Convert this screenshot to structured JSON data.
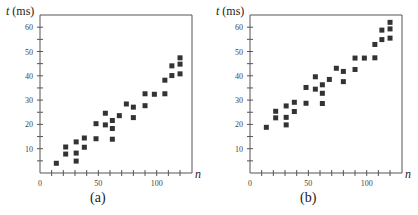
{
  "chart_data": [
    {
      "type": "scatter",
      "caption": "(a)",
      "xlabel": "n",
      "ylabel": "t (ms)",
      "ylabel_var": "t",
      "ylabel_unit": "(ms)",
      "xlim": [
        0,
        130
      ],
      "ylim": [
        0,
        65
      ],
      "xticks_major": [
        0,
        50,
        100
      ],
      "xtick_step": 10,
      "yticks_major": [
        10,
        20,
        30,
        40,
        50,
        60
      ],
      "ytick_step": 5,
      "grid": false,
      "marker": "square",
      "marker_color": "#333333",
      "points": [
        [
          14,
          4
        ],
        [
          22,
          10.7
        ],
        [
          22,
          7.8
        ],
        [
          31,
          12.8
        ],
        [
          31,
          8.2
        ],
        [
          31,
          4.9
        ],
        [
          38,
          14.4
        ],
        [
          38,
          10.6
        ],
        [
          48,
          20.3
        ],
        [
          48,
          14.1
        ],
        [
          56,
          24.6
        ],
        [
          56,
          19.8
        ],
        [
          62,
          21.6
        ],
        [
          62,
          18.3
        ],
        [
          62,
          13.9
        ],
        [
          68,
          23.6
        ],
        [
          74,
          28.4
        ],
        [
          80,
          27.1
        ],
        [
          80,
          22.8
        ],
        [
          90,
          32.6
        ],
        [
          90,
          27.7
        ],
        [
          98,
          32.4
        ],
        [
          107,
          32.6
        ],
        [
          107,
          38.2
        ],
        [
          113,
          44.1
        ],
        [
          113,
          40.1
        ],
        [
          120,
          47.4
        ],
        [
          120,
          44.8
        ],
        [
          120,
          40.8
        ]
      ]
    },
    {
      "type": "scatter",
      "caption": "(b)",
      "xlabel": "n",
      "ylabel": "t (ms)",
      "ylabel_var": "t",
      "ylabel_unit": "(ms)",
      "xlim": [
        0,
        130
      ],
      "ylim": [
        0,
        65
      ],
      "xticks_major": [
        0,
        50,
        100
      ],
      "xtick_step": 10,
      "yticks_major": [
        10,
        20,
        30,
        40,
        50,
        60
      ],
      "ytick_step": 5,
      "grid": false,
      "marker": "square",
      "marker_color": "#333333",
      "points": [
        [
          14,
          18.8
        ],
        [
          22,
          25.4
        ],
        [
          22,
          22.7
        ],
        [
          31,
          27.6
        ],
        [
          31,
          22.9
        ],
        [
          31,
          19.8
        ],
        [
          38,
          29.1
        ],
        [
          38,
          25.3
        ],
        [
          48,
          35.2
        ],
        [
          48,
          28.7
        ],
        [
          56,
          39.6
        ],
        [
          56,
          34.5
        ],
        [
          62,
          36.3
        ],
        [
          62,
          32.8
        ],
        [
          62,
          28.6
        ],
        [
          68,
          38.5
        ],
        [
          74,
          43.1
        ],
        [
          80,
          41.8
        ],
        [
          80,
          37.6
        ],
        [
          90,
          47.3
        ],
        [
          90,
          42.6
        ],
        [
          98,
          47.3
        ],
        [
          107,
          47.4
        ],
        [
          107,
          52.9
        ],
        [
          113,
          58.8
        ],
        [
          113,
          54.9
        ],
        [
          120,
          62
        ],
        [
          120,
          59.3
        ],
        [
          120,
          55.5
        ]
      ]
    }
  ]
}
